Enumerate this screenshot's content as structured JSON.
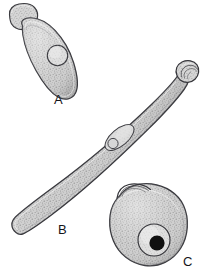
{
  "figure": {
    "kind": "scientific-line-drawing-plate",
    "background_color": "#ffffff",
    "ink_color": "#2b2b2f",
    "body_fill_color": "#c9c9c9",
    "stipple_color": "#7a7a7a",
    "highlight_color": "#e3e3e3",
    "nucleolus_color": "#111111",
    "panels": [
      {
        "id": "A",
        "label": "A",
        "name": "specimen-a",
        "description": "Elongate club-shaped body with a trapezoidal anterior sucker cap at the upper left and a single rounded nucleus in the anterior third.",
        "parts": [
          "anterior-sucker-cap",
          "body",
          "nucleus"
        ],
        "label_position": {
          "x": 54,
          "y": 93
        }
      },
      {
        "id": "B",
        "label": "B",
        "name": "specimen-b",
        "description": "Long slender spindle-shaped body oriented diagonally from lower left to upper right, with a knobbed sucker at the upper right tip and an elongate vesicle enclosing a small nucleus near the centre.",
        "parts": [
          "terminal-knob-sucker",
          "body",
          "central-vesicle",
          "nucleus"
        ],
        "label_position": {
          "x": 58,
          "y": 223
        }
      },
      {
        "id": "C",
        "label": "C",
        "name": "specimen-c",
        "description": "Rounded ovoid body with a small hooked flap at the upper left margin and a large pale nucleus containing a dense dark nucleolus in the lower right quadrant.",
        "parts": [
          "apical-flap",
          "body",
          "nucleus",
          "nucleolus"
        ],
        "label_position": {
          "x": 183,
          "y": 255
        }
      }
    ]
  }
}
